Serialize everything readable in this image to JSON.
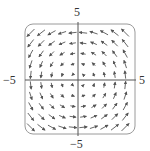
{
  "figure": {
    "type": "vector-field",
    "field_description": "F(x, y) = -y i + x j (counterclockwise rotation)",
    "x_range": [
      -5,
      5
    ],
    "y_range": [
      -5,
      5
    ],
    "labels": {
      "x_min": "−5",
      "x_max": "5",
      "y_min": "−5",
      "y_max": "5"
    },
    "grid": {
      "nx": 10,
      "ny": 10
    },
    "colors": {
      "arrow": "#555555",
      "axis": "#555555",
      "frame": "#9a9a9a",
      "label": "#333333"
    }
  }
}
